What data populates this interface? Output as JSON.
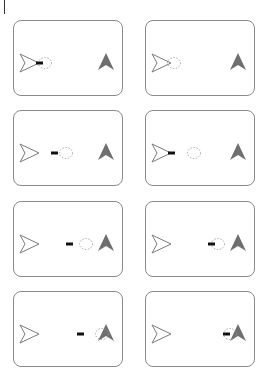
{
  "figure": {
    "colors": {
      "panel_border": "#8a8a8a",
      "outline_arrow": "#7a7a7a",
      "filled_arrow": "#6f6f6f",
      "projectile": "#111111",
      "dotted_circle": "#9a9a9a"
    },
    "frames": [
      {
        "id": 1,
        "col": 0,
        "row": 0,
        "dash_x": 22,
        "circle_x": 25,
        "attached": true
      },
      {
        "id": 2,
        "col": 1,
        "row": 0,
        "dash_x": null,
        "circle_x": 22,
        "attached": true
      },
      {
        "id": 3,
        "col": 0,
        "row": 1,
        "dash_x": 37,
        "circle_x": 46,
        "attached": false
      },
      {
        "id": 4,
        "col": 1,
        "row": 1,
        "dash_x": 22,
        "circle_x": 42,
        "attached": true
      },
      {
        "id": 5,
        "col": 0,
        "row": 2,
        "dash_x": 52,
        "circle_x": 66,
        "attached": false
      },
      {
        "id": 6,
        "col": 1,
        "row": 2,
        "dash_x": 62,
        "circle_x": 66,
        "attached": false
      },
      {
        "id": 7,
        "col": 0,
        "row": 3,
        "dash_x": 63,
        "circle_x": 82,
        "attached": false
      },
      {
        "id": 8,
        "col": 1,
        "row": 3,
        "dash_x": 77,
        "circle_x": 78,
        "attached": false
      }
    ]
  }
}
